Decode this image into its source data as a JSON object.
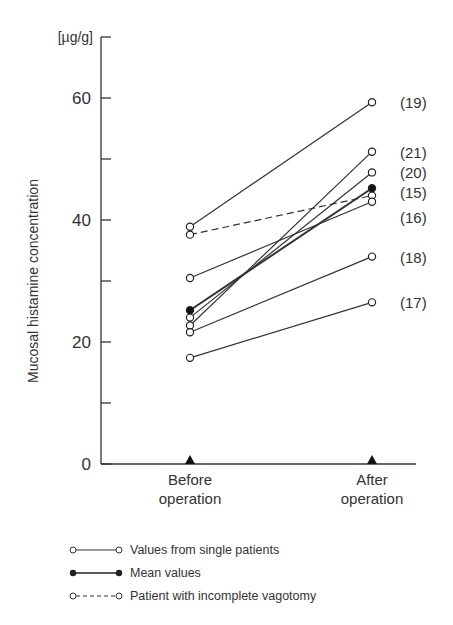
{
  "chart_data": {
    "type": "line",
    "title": "",
    "ylabel": "Mucosal histamine concentration",
    "yunit": "[µg/g]",
    "ylim": [
      0,
      70
    ],
    "yticks": [
      0,
      10,
      20,
      30,
      40,
      50,
      60,
      70
    ],
    "ytick_labels": [
      "0",
      "",
      "20",
      "",
      "40",
      "",
      "60",
      ""
    ],
    "categories": [
      "Before\noperation",
      "After\noperation"
    ],
    "category_lines": [
      [
        "Before",
        "operation"
      ],
      [
        "After",
        "operation"
      ]
    ],
    "series": [
      {
        "name": "(19)",
        "kind": "single",
        "values": [
          38.9,
          59.3
        ]
      },
      {
        "name": "(21)",
        "kind": "single",
        "values": [
          22.7,
          51.2
        ]
      },
      {
        "name": "(20)",
        "kind": "single",
        "values": [
          24.0,
          47.8
        ]
      },
      {
        "name": "(15)",
        "kind": "incomplete",
        "values": [
          37.6,
          44.0
        ]
      },
      {
        "name": "(16)",
        "kind": "single",
        "values": [
          30.5,
          43.0
        ]
      },
      {
        "name": "(18)",
        "kind": "single",
        "values": [
          21.6,
          34.0
        ]
      },
      {
        "name": "(17)",
        "kind": "single",
        "values": [
          17.4,
          26.5
        ]
      },
      {
        "name": "Mean",
        "kind": "mean",
        "values": [
          25.2,
          45.2
        ]
      }
    ],
    "point_labels": [
      {
        "text": "(19)",
        "y": 59.3
      },
      {
        "text": "(21)",
        "y": 51.2
      },
      {
        "text": "(20)",
        "y": 47.8
      },
      {
        "text": "(15)",
        "y": 44.6
      },
      {
        "text": "(16)",
        "y": 40.5
      },
      {
        "text": "(18)",
        "y": 34.0
      },
      {
        "text": "(17)",
        "y": 26.5
      }
    ],
    "legend": [
      {
        "style": "single",
        "label": "Values from single patients"
      },
      {
        "style": "mean",
        "label": "Mean values"
      },
      {
        "style": "incomplete",
        "label": "Patient with incomplete vagotomy"
      }
    ],
    "grid": false
  }
}
